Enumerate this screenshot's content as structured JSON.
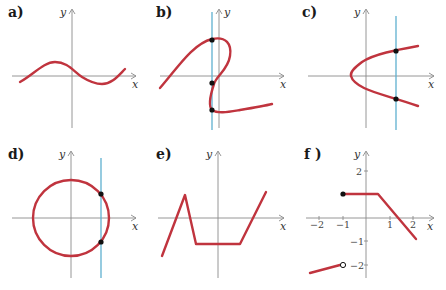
{
  "panels": [
    {
      "id": "a",
      "label": "a)",
      "x_axis": "x",
      "y_axis": "y",
      "shape": "sine-like wave crossing the origin",
      "vertical_line": false,
      "points": 0
    },
    {
      "id": "b",
      "label": "b)",
      "x_axis": "x",
      "y_axis": "y",
      "shape": "S-shaped curve folding back on itself",
      "vertical_line": true,
      "points": 3
    },
    {
      "id": "c",
      "label": "c)",
      "x_axis": "x",
      "y_axis": "y",
      "shape": "sideways parabola opening right",
      "vertical_line": true,
      "points": 2
    },
    {
      "id": "d",
      "label": "d)",
      "x_axis": "x",
      "y_axis": "y",
      "shape": "circle centered at origin",
      "vertical_line": true,
      "points": 2
    },
    {
      "id": "e",
      "label": "e)",
      "x_axis": "x",
      "y_axis": "y",
      "shape": "piecewise linear: rise, drop, flat, rise",
      "vertical_line": false,
      "points": 0
    },
    {
      "id": "f",
      "label": "f )",
      "x_axis": "x",
      "y_axis": "y",
      "shape": "piecewise linear with jump at x = -1",
      "x_ticks": [
        "−2",
        "−1",
        "1",
        "2"
      ],
      "y_ticks": [
        "2",
        "−1",
        "−2"
      ],
      "segments": [
        {
          "from": [
            -2.4,
            -2.4
          ],
          "to": [
            -1,
            -2
          ],
          "end": "open"
        },
        {
          "from": [
            -1,
            1
          ],
          "to": [
            0.5,
            1
          ],
          "start": "closed"
        },
        {
          "from": [
            0.5,
            1
          ],
          "to": [
            2.2,
            -1
          ]
        }
      ]
    }
  ],
  "colors": {
    "curve": "#c0343e",
    "vertical_line": "#5fb0cf",
    "axis": "#8a8a8a",
    "point": "#111111"
  }
}
